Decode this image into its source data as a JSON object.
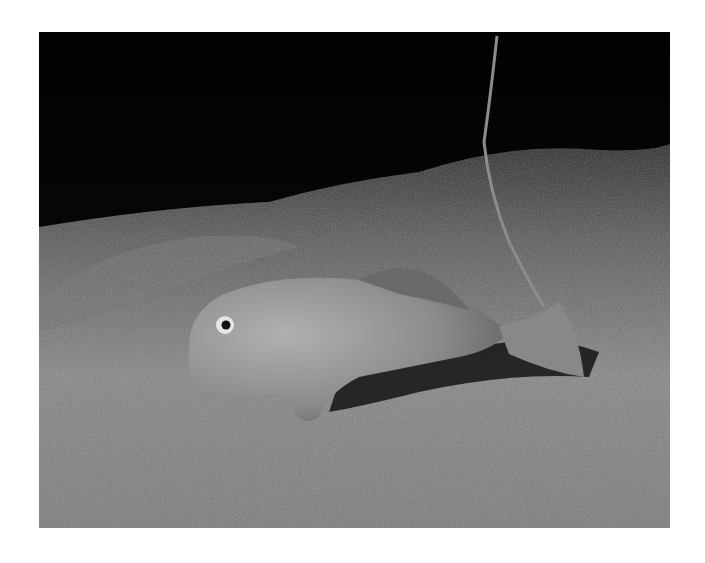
{
  "image": {
    "alt": "Grayscale underwater photograph of a bottom-dwelling fish resting on a sandy seafloor, with a thin rope or stalk rising in the background against dark water",
    "subject": "fish on sandy seafloor",
    "tone": "grayscale",
    "colors": {
      "background": "#ffffff",
      "water": "#050505",
      "sand_far": "#4a4a4a",
      "sand_near": "#8a8a8a",
      "fish_body": "#9a9a9a",
      "fish_shadow": "#1a1a1a"
    }
  }
}
